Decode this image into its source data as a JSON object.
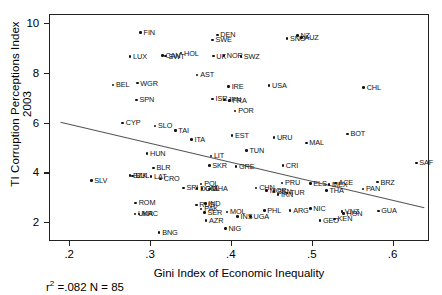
{
  "chart_data": {
    "type": "scatter",
    "title": "",
    "xlabel": "Gini Index of Economic Inequality",
    "ylabel": "TI Corruption Perceptions Index 2003",
    "xlim": [
      0.175,
      0.645
    ],
    "ylim": [
      1.25,
      10.35
    ],
    "xticks": [
      ".2",
      ".3",
      ".4",
      ".5",
      ".6"
    ],
    "xtick_values": [
      0.2,
      0.3,
      0.4,
      0.5,
      0.6
    ],
    "yticks": [
      "2",
      "4",
      "6",
      "8",
      "10"
    ],
    "ytick_values": [
      2,
      4,
      6,
      8,
      10
    ],
    "grid": false,
    "legend": null,
    "annotation": "r² =.082 N = 85",
    "r_squared": 0.082,
    "n": 85,
    "trendline": {
      "x0": 0.188,
      "y0": 6.05,
      "x1": 0.638,
      "y1": 2.62
    },
    "points": [
      {
        "label": "FIN",
        "x": 0.287,
        "y": 9.65
      },
      {
        "label": "DEN",
        "x": 0.382,
        "y": 9.55
      },
      {
        "label": "SWE",
        "x": 0.376,
        "y": 9.35
      },
      {
        "label": "SNG",
        "x": 0.468,
        "y": 9.4
      },
      {
        "label": "NZ",
        "x": 0.481,
        "y": 9.52
      },
      {
        "label": "AUZ",
        "x": 0.486,
        "y": 9.45
      },
      {
        "label": "LUX",
        "x": 0.274,
        "y": 8.68
      },
      {
        "label": "CAN",
        "x": 0.314,
        "y": 8.72
      },
      {
        "label": "SWT",
        "x": 0.318,
        "y": 8.7
      },
      {
        "label": "HOL",
        "x": 0.337,
        "y": 8.82
      },
      {
        "label": "UK",
        "x": 0.377,
        "y": 8.7
      },
      {
        "label": "NOR",
        "x": 0.39,
        "y": 8.72
      },
      {
        "label": "SWZ",
        "x": 0.411,
        "y": 8.68
      },
      {
        "label": "AST",
        "x": 0.357,
        "y": 7.95
      },
      {
        "label": "BEL",
        "x": 0.253,
        "y": 7.55
      },
      {
        "label": "WGR",
        "x": 0.283,
        "y": 7.62
      },
      {
        "label": "IRE",
        "x": 0.396,
        "y": 7.48
      },
      {
        "label": "USA",
        "x": 0.446,
        "y": 7.52
      },
      {
        "label": "SPN",
        "x": 0.282,
        "y": 6.95
      },
      {
        "label": "ISR",
        "x": 0.376,
        "y": 6.98
      },
      {
        "label": "JPN",
        "x": 0.391,
        "y": 6.95
      },
      {
        "label": "FRA",
        "x": 0.397,
        "y": 6.92
      },
      {
        "label": "POR",
        "x": 0.404,
        "y": 6.5
      },
      {
        "label": "CHL",
        "x": 0.563,
        "y": 7.45
      },
      {
        "label": "CYP",
        "x": 0.265,
        "y": 6.02
      },
      {
        "label": "SLO",
        "x": 0.305,
        "y": 5.9
      },
      {
        "label": "TAI",
        "x": 0.33,
        "y": 5.72
      },
      {
        "label": "ITA",
        "x": 0.35,
        "y": 5.35
      },
      {
        "label": "EST",
        "x": 0.4,
        "y": 5.52
      },
      {
        "label": "URU",
        "x": 0.452,
        "y": 5.45
      },
      {
        "label": "MAL",
        "x": 0.492,
        "y": 5.22
      },
      {
        "label": "BOT",
        "x": 0.543,
        "y": 5.58
      },
      {
        "label": "HUN",
        "x": 0.295,
        "y": 4.8
      },
      {
        "label": "TUN",
        "x": 0.418,
        "y": 4.92
      },
      {
        "label": "LIT",
        "x": 0.374,
        "y": 4.7
      },
      {
        "label": "SKR",
        "x": 0.372,
        "y": 4.32
      },
      {
        "label": "GRE",
        "x": 0.405,
        "y": 4.28
      },
      {
        "label": "CRI",
        "x": 0.463,
        "y": 4.32
      },
      {
        "label": "BLR",
        "x": 0.303,
        "y": 4.22
      },
      {
        "label": "SAF",
        "x": 0.628,
        "y": 4.42
      },
      {
        "label": "BZK",
        "x": 0.274,
        "y": 3.92
      },
      {
        "label": "BUL",
        "x": 0.277,
        "y": 3.9
      },
      {
        "label": "LAT",
        "x": 0.3,
        "y": 3.88
      },
      {
        "label": "CRO",
        "x": 0.312,
        "y": 3.78
      },
      {
        "label": "SLV",
        "x": 0.226,
        "y": 3.72
      },
      {
        "label": "POL",
        "x": 0.362,
        "y": 3.58
      },
      {
        "label": "CHN",
        "x": 0.43,
        "y": 3.42
      },
      {
        "label": "PRU",
        "x": 0.462,
        "y": 3.62
      },
      {
        "label": "ELS",
        "x": 0.497,
        "y": 3.6
      },
      {
        "label": "MEX",
        "x": 0.52,
        "y": 3.55
      },
      {
        "label": "ACE",
        "x": 0.528,
        "y": 3.62
      },
      {
        "label": "BRZ",
        "x": 0.58,
        "y": 3.65
      },
      {
        "label": "PAN",
        "x": 0.562,
        "y": 3.38
      },
      {
        "label": "SRI",
        "x": 0.34,
        "y": 3.42
      },
      {
        "label": "DOM",
        "x": 0.357,
        "y": 3.4
      },
      {
        "label": "COL",
        "x": 0.363,
        "y": 3.4
      },
      {
        "label": "GHA",
        "x": 0.372,
        "y": 3.38
      },
      {
        "label": "MOR",
        "x": 0.443,
        "y": 3.32
      },
      {
        "label": "SEN",
        "x": 0.452,
        "y": 3.28
      },
      {
        "label": "IRN",
        "x": 0.457,
        "y": 3.15
      },
      {
        "label": "TUR",
        "x": 0.468,
        "y": 3.22
      },
      {
        "label": "THA",
        "x": 0.517,
        "y": 3.32
      },
      {
        "label": "ROM",
        "x": 0.281,
        "y": 2.82
      },
      {
        "label": "RUS",
        "x": 0.356,
        "y": 2.73
      },
      {
        "label": "IND",
        "x": 0.367,
        "y": 2.8
      },
      {
        "label": "PAK",
        "x": 0.362,
        "y": 2.58
      },
      {
        "label": "SER",
        "x": 0.366,
        "y": 2.44
      },
      {
        "label": "MOL",
        "x": 0.394,
        "y": 2.45
      },
      {
        "label": "UKR",
        "x": 0.28,
        "y": 2.38
      },
      {
        "label": "MAC",
        "x": 0.285,
        "y": 2.38
      },
      {
        "label": "PHL",
        "x": 0.44,
        "y": 2.52
      },
      {
        "label": "ARG",
        "x": 0.472,
        "y": 2.52
      },
      {
        "label": "NIC",
        "x": 0.497,
        "y": 2.6
      },
      {
        "label": "VNZ",
        "x": 0.536,
        "y": 2.48
      },
      {
        "label": "HON",
        "x": 0.538,
        "y": 2.4
      },
      {
        "label": "GUA",
        "x": 0.581,
        "y": 2.5
      },
      {
        "label": "INS",
        "x": 0.407,
        "y": 2.28
      },
      {
        "label": "UGA",
        "x": 0.423,
        "y": 2.28
      },
      {
        "label": "AZR",
        "x": 0.368,
        "y": 2.1
      },
      {
        "label": "GEO",
        "x": 0.509,
        "y": 2.12
      },
      {
        "label": "KEN",
        "x": 0.527,
        "y": 2.18
      },
      {
        "label": "NIG",
        "x": 0.392,
        "y": 1.8
      },
      {
        "label": "BNG",
        "x": 0.31,
        "y": 1.62
      }
    ]
  },
  "axis": {
    "y_title": "TI Corruption Perceptions Index 2003",
    "x_title": "Gini Index of Economic Inequality",
    "caption_prefix": "r",
    "caption_sup": "2",
    "caption_rest": " =.082 N = 85"
  }
}
